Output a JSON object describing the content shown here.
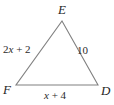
{
  "figure": {
    "type": "triangle-diagram",
    "background_color": "#ffffff",
    "stroke_color": "#808080",
    "text_color": "#262626"
  },
  "vertices": [
    {
      "name": "E",
      "label": "E",
      "position": "top"
    },
    {
      "name": "F",
      "label": "F",
      "position": "bottom-left"
    },
    {
      "name": "D",
      "label": "D",
      "position": "bottom-right"
    }
  ],
  "sides": [
    {
      "name": "EF",
      "label": "2x + 2",
      "label_parts": {
        "coefficient": "2",
        "variable": "x",
        "operator": "+",
        "constant": "2"
      },
      "position": "left"
    },
    {
      "name": "ED",
      "label": "10",
      "position": "right"
    },
    {
      "name": "FD",
      "label": "x + 4",
      "label_parts": {
        "variable": "x",
        "operator": "+",
        "constant": "4"
      },
      "position": "bottom"
    }
  ],
  "geometry": {
    "apex_x": 62,
    "apex_y": 21,
    "left_x": 16,
    "left_y": 85,
    "right_x": 98,
    "right_y": 85
  }
}
